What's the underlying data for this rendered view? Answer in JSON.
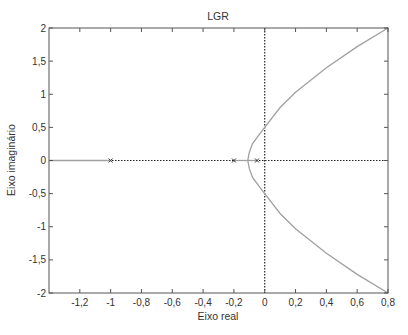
{
  "chart_data": {
    "type": "line",
    "title": "LGR",
    "xlabel": "Eixo real",
    "ylabel": "Eixo imaginário",
    "xlim": [
      -1.4,
      0.8
    ],
    "ylim": [
      -2,
      2
    ],
    "xticks": [
      -1.2,
      -1,
      -0.8,
      -0.6,
      -0.4,
      -0.2,
      0,
      0.2,
      0.4,
      0.6,
      0.8
    ],
    "xtick_labels": [
      "-1,2",
      "-1",
      "-0,8",
      "-0,6",
      "-0,4",
      "-0,2",
      "0",
      "0,2",
      "0,4",
      "0,6",
      "0,8"
    ],
    "yticks": [
      -2,
      -1.5,
      -1,
      -0.5,
      0,
      0.5,
      1,
      1.5,
      2
    ],
    "ytick_labels": [
      "-2",
      "-1,5",
      "-1",
      "-0,5",
      "0",
      "0,5",
      "1",
      "1,5",
      "2"
    ],
    "grid": false,
    "poles": [
      {
        "re": -1,
        "im": 0
      },
      {
        "re": -0.2,
        "im": 0
      },
      {
        "re": -0.05,
        "im": 0
      }
    ],
    "series": [
      {
        "name": "real-axis-branch-left",
        "points": [
          [
            -1.4,
            0
          ],
          [
            -1,
            0
          ]
        ]
      },
      {
        "name": "real-axis-branch-mid",
        "points": [
          [
            -0.2,
            0
          ],
          [
            -0.05,
            0
          ]
        ]
      },
      {
        "name": "upper-branch",
        "points": [
          [
            -0.11,
            0
          ],
          [
            -0.1,
            0.12
          ],
          [
            -0.08,
            0.25
          ],
          [
            -0.04,
            0.38
          ],
          [
            0,
            0.5
          ],
          [
            0.1,
            0.8
          ],
          [
            0.2,
            1.03
          ],
          [
            0.4,
            1.4
          ],
          [
            0.6,
            1.72
          ],
          [
            0.8,
            2.0
          ]
        ]
      },
      {
        "name": "lower-branch",
        "points": [
          [
            -0.11,
            0
          ],
          [
            -0.1,
            -0.12
          ],
          [
            -0.08,
            -0.25
          ],
          [
            -0.04,
            -0.38
          ],
          [
            0,
            -0.5
          ],
          [
            0.1,
            -0.8
          ],
          [
            0.2,
            -1.03
          ],
          [
            0.4,
            -1.4
          ],
          [
            0.6,
            -1.72
          ],
          [
            0.8,
            -2.0
          ]
        ]
      }
    ],
    "colors": {
      "locus": "#a0a0a0",
      "axes": "#222222",
      "frame": "#555555"
    }
  }
}
